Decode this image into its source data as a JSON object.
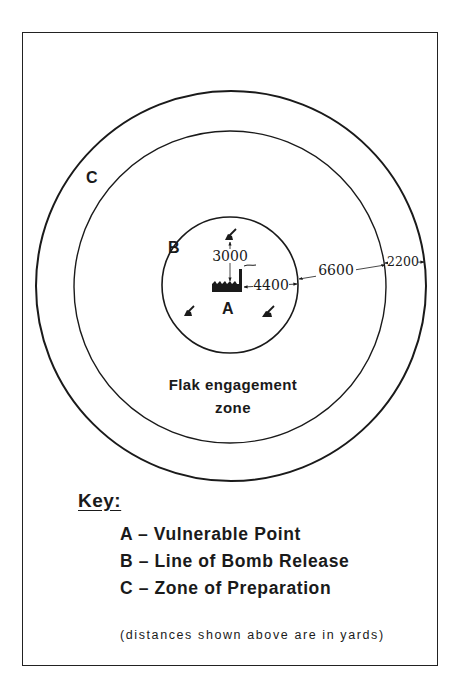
{
  "diagram": {
    "labels": {
      "zone_c": "C",
      "zone_b": "B",
      "point_a": "A",
      "flak_zone_line1": "Flak engagement",
      "flak_zone_line2": "zone"
    },
    "distances": {
      "gun_to_point": "3000",
      "point_to_bomb_release": "4400",
      "bomb_release_to_preparation": "6600",
      "preparation_width": "2200"
    },
    "icons": {
      "target": "factory-icon",
      "guns": [
        "anti-aircraft-gun-icon",
        "anti-aircraft-gun-icon",
        "anti-aircraft-gun-icon"
      ]
    },
    "colors": {
      "ink": "#1a1a1a",
      "paper": "#ffffff"
    }
  },
  "key": {
    "title": "Key:",
    "items": [
      {
        "letter": "A",
        "text": "A – Vulnerable Point"
      },
      {
        "letter": "B",
        "text": "B – Line of Bomb Release"
      },
      {
        "letter": "C",
        "text": "C – Zone of Preparation"
      }
    ],
    "note": "(distances shown above are in yards)"
  }
}
